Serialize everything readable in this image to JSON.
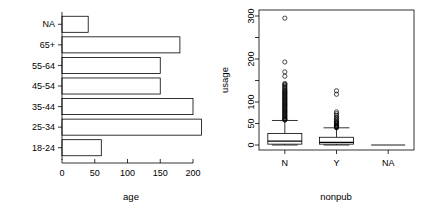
{
  "figure": {
    "layout": "two-panel-side-by-side",
    "panels": [
      "barplot-age",
      "boxplot-usage-by-nonpub"
    ],
    "background_color": "#ffffff",
    "ink_color": "#000000"
  },
  "chart_data": [
    {
      "type": "bar",
      "orientation": "horizontal",
      "title": "",
      "xlabel": "age",
      "ylabel": "",
      "categories": [
        "18-24",
        "25-34",
        "35-44",
        "45-54",
        "55-64",
        "65+",
        "NA"
      ],
      "values": [
        60,
        213,
        200,
        150,
        150,
        180,
        40
      ],
      "xlim": [
        0,
        215
      ],
      "xticks": [
        0,
        50,
        100,
        150,
        200
      ],
      "xtick_labels": [
        "0",
        "50",
        "100",
        "150",
        "200"
      ],
      "grid": false,
      "legend": null,
      "bar_fill": "#ffffff",
      "bar_border": "#000000"
    },
    {
      "type": "boxplot",
      "title": "",
      "xlabel": "nonpub",
      "ylabel": "usage",
      "categories": [
        "N",
        "Y",
        "NA"
      ],
      "ylim": [
        0,
        300
      ],
      "yticks": [
        0,
        50,
        100,
        150,
        200,
        250,
        300
      ],
      "ytick_labels": [
        "0",
        "50",
        "100",
        "150",
        "200",
        "250",
        "300"
      ],
      "ytick_labels_shown": [
        "0",
        "50",
        "100",
        "200",
        "300"
      ],
      "grid": false,
      "legend": null,
      "boxes": [
        {
          "name": "N",
          "whisker_low": 0,
          "q1": 2,
          "median": 9,
          "q3": 27,
          "whisker_high": 57,
          "outliers": [
            295,
            193,
            170,
            160,
            143,
            141,
            139,
            136,
            133,
            131,
            128,
            126,
            124,
            122,
            120,
            118,
            116,
            114,
            112,
            110,
            108,
            106,
            104,
            102,
            100,
            98,
            96,
            94,
            92,
            90,
            88,
            86,
            84,
            82,
            80,
            78,
            76,
            74,
            72,
            70,
            68,
            66,
            64,
            62,
            60,
            59,
            58
          ]
        },
        {
          "name": "Y",
          "whisker_low": 0,
          "q1": 2,
          "median": 6,
          "q3": 18,
          "whisker_high": 40,
          "outliers": [
            126,
            118,
            77,
            73,
            69,
            65,
            62,
            59,
            56,
            54,
            52,
            50,
            48,
            46,
            44,
            43,
            42,
            41,
            40
          ]
        },
        {
          "name": "NA",
          "whisker_low": 0,
          "q1": 0,
          "median": 0,
          "q3": 0,
          "whisker_high": 0,
          "outliers": []
        }
      ]
    }
  ]
}
